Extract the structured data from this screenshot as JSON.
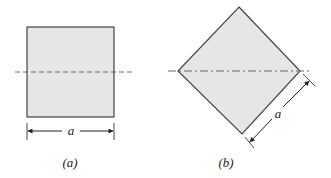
{
  "figure_a": {
    "caption": "(a)",
    "dimension_label": "a",
    "shape": "square"
  },
  "figure_b": {
    "caption": "(b)",
    "dimension_label": "a",
    "shape": "square rotated 45 degrees (diamond)"
  },
  "colors": {
    "fill": "#e6e6e6",
    "stroke": "#444444",
    "axis_dash": "#666666"
  }
}
